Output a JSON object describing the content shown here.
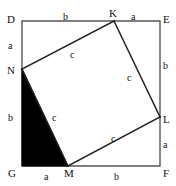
{
  "figure": {
    "kind": "geometry-diagram",
    "canvas": {
      "width": 176,
      "height": 186
    },
    "colors": {
      "stroke": "#555555",
      "inner_stroke": "#222222",
      "fill_triangle": "#000000",
      "background": "#ffffff",
      "text": "#111111"
    }
  },
  "outer_square": {
    "name": "DEFG",
    "corners": [
      {
        "id": "D",
        "label": "D",
        "x": 22,
        "y": 21,
        "label_x": 7,
        "label_y": 14
      },
      {
        "id": "E",
        "label": "E",
        "x": 160,
        "y": 21,
        "label_x": 163,
        "label_y": 14
      },
      {
        "id": "F",
        "label": "F",
        "x": 160,
        "y": 166,
        "label_x": 163,
        "label_y": 168
      },
      {
        "id": "G",
        "label": "G",
        "x": 22,
        "y": 166,
        "label_x": 8,
        "label_y": 168
      }
    ]
  },
  "inner_square": {
    "name": "KLMN",
    "vertices": [
      {
        "id": "K",
        "label": "K",
        "x": 114,
        "y": 21,
        "label_x": 109,
        "label_y": 8
      },
      {
        "id": "L",
        "label": "L",
        "x": 160,
        "y": 117,
        "label_x": 163,
        "label_y": 114
      },
      {
        "id": "M",
        "label": "M",
        "x": 68,
        "y": 166,
        "label_x": 64,
        "label_y": 168
      },
      {
        "id": "N",
        "label": "N",
        "x": 22,
        "y": 69,
        "label_x": 7,
        "label_y": 65
      }
    ]
  },
  "shaded_triangle": {
    "name": "GNM",
    "points": "22,69 68,166 22,166",
    "fill": "#000000"
  },
  "side_labels": [
    {
      "id": "top-b",
      "text": "b",
      "x": 63,
      "y": 12,
      "segment": "D-K",
      "side": "leg-b"
    },
    {
      "id": "top-a",
      "text": "a",
      "x": 131,
      "y": 12,
      "segment": "K-E",
      "side": "leg-a"
    },
    {
      "id": "left-a",
      "text": "a",
      "x": 8,
      "y": 41,
      "segment": "D-N",
      "side": "leg-a"
    },
    {
      "id": "left-b",
      "text": "b",
      "x": 8,
      "y": 113,
      "segment": "N-G",
      "side": "leg-b"
    },
    {
      "id": "right-b",
      "text": "b",
      "x": 163,
      "y": 61,
      "segment": "E-L",
      "side": "leg-b"
    },
    {
      "id": "right-a",
      "text": "a",
      "x": 163,
      "y": 140,
      "segment": "L-F",
      "side": "leg-a"
    },
    {
      "id": "bottom-a",
      "text": "a",
      "x": 44,
      "y": 172,
      "segment": "G-M",
      "side": "leg-a"
    },
    {
      "id": "bottom-b",
      "text": "b",
      "x": 114,
      "y": 172,
      "segment": "M-F",
      "side": "leg-b"
    }
  ],
  "hypotenuse_labels": [
    {
      "id": "c-top-left",
      "text": "c",
      "x": 70,
      "y": 50,
      "segment": "N-K"
    },
    {
      "id": "c-top-right",
      "text": "c",
      "x": 127,
      "y": 73,
      "segment": "K-L"
    },
    {
      "id": "c-bottom-left",
      "text": "c",
      "x": 52,
      "y": 113,
      "segment": "N-M"
    },
    {
      "id": "c-bottom-right",
      "text": "c",
      "x": 111,
      "y": 134,
      "segment": "M-L"
    }
  ],
  "geometry_relation": {
    "statement": "a² + b² = c²",
    "legs": [
      "a",
      "b"
    ],
    "hypotenuse": "c"
  }
}
